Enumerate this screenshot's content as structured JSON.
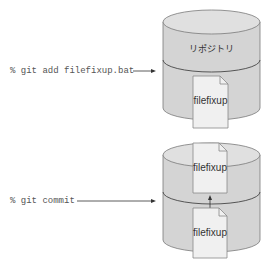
{
  "steps": [
    {
      "command": "% git add filefixup.bat",
      "repository_label": "リポジトリ",
      "files": [
        "filefixup"
      ]
    },
    {
      "command": "% git commit",
      "files": [
        "filefixup",
        "filefixup"
      ]
    }
  ],
  "colors": {
    "cylinder_fill": "#d4d4d4",
    "cylinder_top": "#e0e0e0",
    "cylinder_stroke": "#7a7a7a",
    "document_fill": "#f0f0f0",
    "arrow": "#333333"
  }
}
